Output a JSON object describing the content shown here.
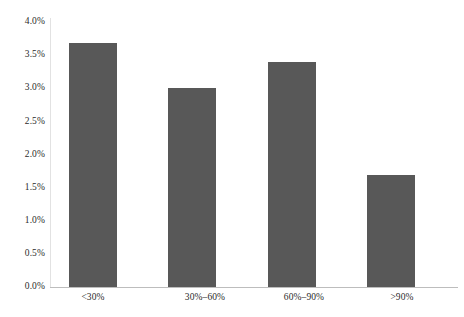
{
  "chart_data": {
    "type": "bar",
    "title": "",
    "subtitle": "",
    "xlabel": "",
    "ylabel": "",
    "categories": [
      "<30%",
      "30%–60%",
      "60%–90%",
      ">90%"
    ],
    "values": [
      3.69,
      3.01,
      3.4,
      1.69
    ],
    "value_labels": [
      "3.69%",
      "3.01%",
      "3.40%",
      "1.69%"
    ],
    "ylim": [
      0.0,
      4.0
    ],
    "ytick_values": [
      0.0,
      0.5,
      1.0,
      1.5,
      2.0,
      2.5,
      3.0,
      3.5,
      4.0
    ],
    "ytick_labels": [
      "0.0%",
      "0.5%",
      "1.0%",
      "1.5%",
      "2.0%",
      "2.5%",
      "3.0%",
      "3.5%",
      "4.0%"
    ],
    "grid": false,
    "legend": null,
    "legend_position": "none",
    "annotations": [],
    "series": [
      {
        "name": "",
        "values": [
          3.69,
          3.01,
          3.4,
          1.69
        ]
      }
    ],
    "colors": {
      "bar": "#585858",
      "background": "#ffffff",
      "axis_line": "#bdbdbd",
      "y_axis_line": "#e2e2e2",
      "text": "#2b2b2b"
    }
  }
}
